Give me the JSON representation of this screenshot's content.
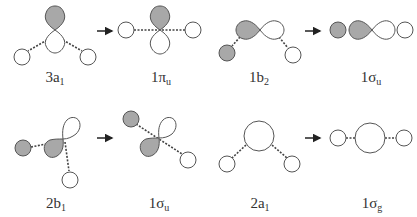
{
  "colors": {
    "filled": "#a8a8a8",
    "stroke": "#555555",
    "empty": "#ffffff",
    "bond": "#444444",
    "arrow": "#222222",
    "text": "#333333"
  },
  "labels": {
    "r1c1": {
      "main": "3a",
      "sub": "1"
    },
    "r1c2": {
      "main": "1π",
      "sub": "u"
    },
    "r1c3": {
      "main": "1b",
      "sub": "2"
    },
    "r1c4": {
      "main": "1σ",
      "sub": "u"
    },
    "r2c1": {
      "main": "2b",
      "sub": "1"
    },
    "r2c2": {
      "main": "1σ",
      "sub": "u"
    },
    "r2c3": {
      "main": "2a",
      "sub": "1"
    },
    "r2c4": {
      "main": "1σ",
      "sub": "g"
    }
  },
  "correlations": [
    {
      "from": "3a1",
      "to": "1πu"
    },
    {
      "from": "1b2",
      "to": "1σu"
    },
    {
      "from": "2b1",
      "to": "1σu"
    },
    {
      "from": "2a1",
      "to": "1σg"
    }
  ]
}
